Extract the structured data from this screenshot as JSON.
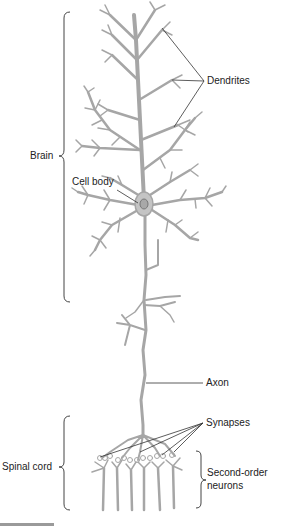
{
  "diagram": {
    "type": "neuron-anatomy",
    "colors": {
      "neuron": "#a6a6a6",
      "leader": "#333333",
      "text": "#222222",
      "bracket": "#444444"
    },
    "regions": [
      {
        "id": "brain",
        "label": "Brain"
      },
      {
        "id": "spinal-cord",
        "label": "Spinal cord"
      }
    ],
    "labels": {
      "dendrites": "Dendrites",
      "cell_body": "Cell body",
      "axon": "Axon",
      "synapses": "Synapses",
      "second_order_line1": "Second-order",
      "second_order_line2": "neurons"
    }
  }
}
